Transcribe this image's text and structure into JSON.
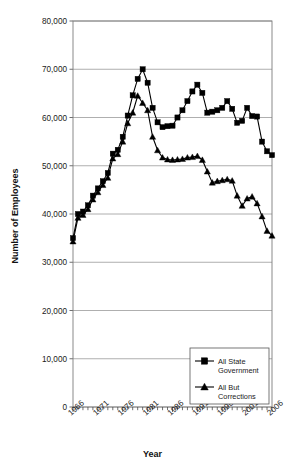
{
  "chart_data": {
    "type": "line",
    "title": "",
    "xlabel": "Year",
    "ylabel": "Number of Employees",
    "xlim": [
      1966,
      2006
    ],
    "ylim": [
      0,
      80000
    ],
    "grid": true,
    "legend_position": "bottom-right",
    "y_ticks": [
      0,
      10000,
      20000,
      30000,
      40000,
      50000,
      60000,
      70000,
      80000
    ],
    "y_tick_labels": [
      "0",
      "10,000",
      "20,000",
      "30,000",
      "40,000",
      "50,000",
      "60,000",
      "70,000",
      "80,000"
    ],
    "x_tick_labels": [
      "1966",
      "1971",
      "1976",
      "1981",
      "1986",
      "1991",
      "1996",
      "2001",
      "2006"
    ],
    "x_tick_label_years": [
      1966,
      1971,
      1976,
      1981,
      1986,
      1991,
      1996,
      2001,
      2006
    ],
    "x_minor_tick_every": 1,
    "x": [
      1966,
      1967,
      1968,
      1969,
      1970,
      1971,
      1972,
      1973,
      1974,
      1975,
      1976,
      1977,
      1978,
      1979,
      1980,
      1981,
      1982,
      1983,
      1984,
      1985,
      1986,
      1987,
      1988,
      1989,
      1990,
      1991,
      1992,
      1993,
      1994,
      1995,
      1996,
      1997,
      1998,
      1999,
      2000,
      2001,
      2002,
      2003,
      2004,
      2005,
      2006
    ],
    "series": [
      {
        "name": "All State Government",
        "marker": "square",
        "values": [
          35000,
          40000,
          40500,
          41800,
          43800,
          45300,
          46800,
          48500,
          52500,
          53300,
          56000,
          60400,
          64600,
          68000,
          70000,
          67200,
          62000,
          59000,
          58000,
          58200,
          58300,
          60000,
          61500,
          63400,
          65400,
          66800,
          65100,
          61000,
          61200,
          61500,
          62000,
          63400,
          61800,
          58900,
          59300,
          62000,
          60300,
          60200,
          55000,
          53000,
          52200
        ]
      },
      {
        "name": "All But Corrections",
        "marker": "triangle",
        "values": [
          34300,
          39200,
          39800,
          41000,
          43000,
          44500,
          46000,
          47500,
          51500,
          52400,
          55000,
          58800,
          61000,
          64500,
          63000,
          61500,
          56000,
          53200,
          51700,
          51300,
          51200,
          51300,
          51400,
          51700,
          51800,
          52000,
          51200,
          48800,
          46500,
          46800,
          47000,
          47200,
          46900,
          43800,
          41700,
          43200,
          43600,
          42200,
          39500,
          36500,
          35500
        ]
      }
    ]
  },
  "legend": {
    "entries": [
      {
        "label_line1": "All State",
        "label_line2": "Government",
        "marker": "square"
      },
      {
        "label_line1": "All But",
        "label_line2": "Corrections",
        "marker": "triangle"
      }
    ]
  },
  "colors": {
    "series": "#000000",
    "grid": "#9a9a9a",
    "frame": "#7d7d7d",
    "background": "#ffffff"
  }
}
